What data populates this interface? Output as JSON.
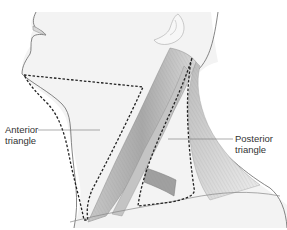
{
  "diagram": {
    "labels": {
      "anterior": [
        "Anterior",
        "triangle"
      ],
      "posterior": [
        "Posterior",
        "triangle"
      ]
    },
    "colors": {
      "skin": "#f3f3f3",
      "outline": "#555555",
      "muscle_light": "#e6e6e6",
      "muscle_dark": "#9a9a9a",
      "dashed_boundary": "#222222",
      "leader_line": "#777777",
      "text": "#333333"
    }
  }
}
